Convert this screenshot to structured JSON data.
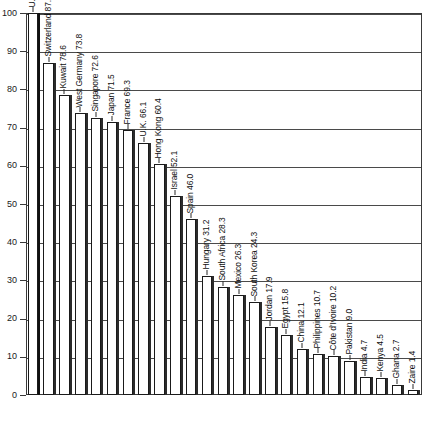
{
  "chart_data": {
    "type": "bar",
    "title": "",
    "subtitle": "",
    "xlabel": "",
    "ylabel": "",
    "ylim": [
      0,
      100
    ],
    "yticks": [
      0,
      10,
      20,
      30,
      40,
      50,
      60,
      70,
      80,
      90,
      100
    ],
    "ytick_labels": [
      "0",
      "10",
      "20",
      "30",
      "40",
      "50",
      "60",
      "70",
      "80",
      "90",
      "100"
    ],
    "grid": true,
    "legend": false,
    "legend_position": "none",
    "label_orientation": "vertical",
    "label_format": "{name} {value}",
    "categories": [
      "U.S.",
      "Switzerland",
      "Kuwait",
      "West Germany",
      "Singapore",
      "Japan",
      "France",
      "U.K.",
      "Hong Kong",
      "Israel",
      "Spain",
      "Hungary",
      "South Africa",
      "Mexico",
      "South Korea",
      "Jordan",
      "Egypt",
      "China",
      "Philippines",
      "Côte d'Ivoire",
      "Pakistan",
      "India",
      "Kenya",
      "Ghana",
      "Zaire"
    ],
    "values": [
      100,
      87.0,
      78.6,
      73.8,
      72.6,
      71.5,
      69.3,
      66.1,
      60.4,
      52.1,
      46.0,
      31.2,
      28.3,
      26.3,
      24.3,
      17.9,
      15.8,
      12.1,
      10.7,
      10.2,
      9.0,
      4.7,
      4.5,
      2.7,
      1.4
    ],
    "bars": [
      {
        "name": "U.S.",
        "value": 100,
        "label": "U.S.  100"
      },
      {
        "name": "Switzerland",
        "value": 87.0,
        "label": "Switzerland  87.0"
      },
      {
        "name": "Kuwait",
        "value": 78.6,
        "label": "Kuwait  78.6"
      },
      {
        "name": "West Germany",
        "value": 73.8,
        "label": "West Germany  73.8"
      },
      {
        "name": "Singapore",
        "value": 72.6,
        "label": "Singapore  72.6"
      },
      {
        "name": "Japan",
        "value": 71.5,
        "label": "Japan  71.5"
      },
      {
        "name": "France",
        "value": 69.3,
        "label": "France  69.3"
      },
      {
        "name": "U.K.",
        "value": 66.1,
        "label": "U.K.  66.1"
      },
      {
        "name": "Hong Kong",
        "value": 60.4,
        "label": "Hong Kong  60.4"
      },
      {
        "name": "Israel",
        "value": 52.1,
        "label": "Israel  52.1"
      },
      {
        "name": "Spain",
        "value": 46.0,
        "label": "Spain  46.0"
      },
      {
        "name": "Hungary",
        "value": 31.2,
        "label": "Hungary  31.2"
      },
      {
        "name": "South Africa",
        "value": 28.3,
        "label": "South Africa  28.3"
      },
      {
        "name": "Mexico",
        "value": 26.3,
        "label": "Mexico  26.3"
      },
      {
        "name": "South Korea",
        "value": 24.3,
        "label": "South Korea  24.3"
      },
      {
        "name": "Jordan",
        "value": 17.9,
        "label": "Jordan  17.9"
      },
      {
        "name": "Egypt",
        "value": 15.8,
        "label": "Egypt  15.8"
      },
      {
        "name": "China",
        "value": 12.1,
        "label": "China  12.1"
      },
      {
        "name": "Philippines",
        "value": 10.7,
        "label": "Philippines  10.7"
      },
      {
        "name": "Côte d'Ivoire",
        "value": 10.2,
        "label": "Côte d'Ivoire  10.2"
      },
      {
        "name": "Pakistan",
        "value": 9.0,
        "label": "Pakistan  9.0"
      },
      {
        "name": "India",
        "value": 4.7,
        "label": "India  4.7"
      },
      {
        "name": "Kenya",
        "value": 4.5,
        "label": "Kenya  4.5"
      },
      {
        "name": "Ghana",
        "value": 2.7,
        "label": "Ghana  2.7"
      },
      {
        "name": "Zaire",
        "value": 1.4,
        "label": "Zaire  1.4"
      }
    ],
    "colors": {
      "bar_fill": "#ffffff",
      "bar_stroke": "#1a1a1a",
      "bar_shadow": "#2b2b2b",
      "gridline": "#4a4a4a",
      "axis": "#3a3a3a",
      "text": "#101010",
      "background": "#ffffff"
    }
  }
}
